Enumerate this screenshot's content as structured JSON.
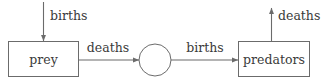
{
  "diagram": {
    "type": "stock-flow",
    "background_color": "#ffffff",
    "line_color": "#6b6b6b",
    "text_color": "#3a3a3a",
    "nodes": [
      {
        "id": "prey",
        "shape": "rectangle",
        "label": "prey",
        "x": 8,
        "y": 41,
        "width": 71,
        "height": 36
      },
      {
        "id": "junction",
        "shape": "circle",
        "label": "",
        "cx": 155,
        "cy": 60,
        "r": 16
      },
      {
        "id": "predators",
        "shape": "rectangle",
        "label": "predators",
        "x": 238,
        "y": 41,
        "width": 72,
        "height": 36
      }
    ],
    "flows": [
      {
        "id": "prey-births",
        "label": "births",
        "direction": "down",
        "from": "external",
        "to": "prey",
        "label_x": 74,
        "label_y": 16
      },
      {
        "id": "prey-deaths",
        "label": "deaths",
        "direction": "right",
        "from": "prey",
        "to": "junction",
        "label_x": 108,
        "label_y": 48
      },
      {
        "id": "predator-births",
        "label": "births",
        "direction": "right",
        "from": "junction",
        "to": "predators",
        "label_x": 205,
        "label_y": 48
      },
      {
        "id": "predator-deaths",
        "label": "deaths",
        "direction": "up",
        "from": "predators",
        "to": "external",
        "label_x": 297,
        "label_y": 16
      }
    ]
  }
}
